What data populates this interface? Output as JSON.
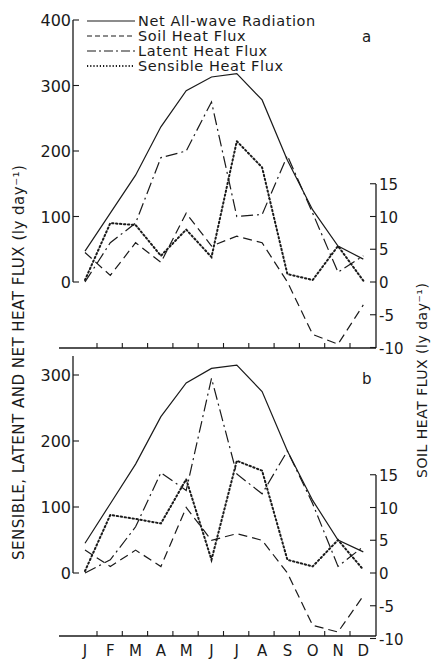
{
  "figure": {
    "left_axis_label": "SENSIBLE, LATENT AND NET HEAT FLUX   (ly day⁻¹)",
    "right_axis_label": "SOIL HEAT FLUX   (ly day⁻¹)",
    "legend": [
      {
        "label": "Net All-wave Radiation",
        "style": "solid"
      },
      {
        "label": "Soil Heat Flux",
        "style": "dashed"
      },
      {
        "label": "Latent Heat Flux",
        "style": "dashdot"
      },
      {
        "label": "Sensible Heat Flux",
        "style": "dotted"
      }
    ],
    "months": [
      "J",
      "F",
      "M",
      "A",
      "M",
      "J",
      "J",
      "A",
      "S",
      "O",
      "N",
      "D"
    ],
    "panel_a_letter": "a",
    "panel_b_letter": "b",
    "panel_a_left_ticks": [
      "0",
      "100",
      "200",
      "300",
      "400"
    ],
    "panel_b_left_ticks": [
      "0",
      "100",
      "200",
      "300"
    ],
    "right_ticks": [
      "-10",
      "-5",
      "0",
      "5",
      "10",
      "15"
    ],
    "ink_color": "#1a1a1a"
  },
  "chart_data": [
    {
      "type": "line",
      "title": "a",
      "categories": [
        "J",
        "F",
        "M",
        "A",
        "M",
        "J",
        "J",
        "A",
        "S",
        "O",
        "N",
        "D"
      ],
      "xlabel": "",
      "ylabel": "SENSIBLE, LATENT AND NET HEAT FLUX (ly day-1)",
      "ylim": [
        0,
        400
      ],
      "y2label": "SOIL HEAT FLUX (ly day-1)",
      "y2lim": [
        -10,
        15
      ],
      "grid": false,
      "legend_position": "top-left",
      "series": [
        {
          "name": "Net All-wave Radiation",
          "axis": "left",
          "values": [
            47,
            105,
            163,
            237,
            292,
            313,
            318,
            278,
            186,
            110,
            55,
            35
          ]
        },
        {
          "name": "Latent Heat Flux",
          "axis": "left",
          "values": [
            0,
            60,
            90,
            190,
            200,
            275,
            100,
            103,
            193,
            105,
            15,
            40
          ]
        },
        {
          "name": "Sensible Heat Flux",
          "axis": "left",
          "values": [
            3,
            90,
            87,
            40,
            80,
            38,
            215,
            175,
            12,
            3,
            55,
            2
          ]
        },
        {
          "name": "Soil Heat Flux",
          "axis": "right",
          "values": [
            4.5,
            1,
            6,
            3,
            10.5,
            5.5,
            7,
            6,
            0,
            -8,
            -9.5,
            -3.5
          ]
        }
      ]
    },
    {
      "type": "line",
      "title": "b",
      "categories": [
        "J",
        "F",
        "M",
        "A",
        "M",
        "J",
        "J",
        "A",
        "S",
        "O",
        "N",
        "D"
      ],
      "xlabel": "",
      "ylabel": "SENSIBLE, LATENT AND NET HEAT FLUX (ly day-1)",
      "ylim": [
        0,
        330
      ],
      "y2label": "SOIL HEAT FLUX (ly day-1)",
      "y2lim": [
        -10,
        15
      ],
      "grid": false,
      "series": [
        {
          "name": "Net All-wave Radiation",
          "axis": "left",
          "values": [
            45,
            105,
            165,
            237,
            288,
            310,
            315,
            275,
            185,
            110,
            50,
            32
          ]
        },
        {
          "name": "Latent Heat Flux",
          "axis": "left",
          "values": [
            0,
            20,
            70,
            152,
            125,
            295,
            150,
            120,
            185,
            105,
            10,
            40
          ]
        },
        {
          "name": "Sensible Heat Flux",
          "axis": "left",
          "values": [
            3,
            88,
            82,
            75,
            142,
            20,
            170,
            155,
            20,
            10,
            50,
            5
          ]
        },
        {
          "name": "Soil Heat Flux",
          "axis": "right",
          "values": [
            3.5,
            1,
            3.5,
            1,
            10,
            5,
            6,
            5,
            0,
            -8,
            -9,
            -3.5
          ]
        }
      ]
    }
  ]
}
